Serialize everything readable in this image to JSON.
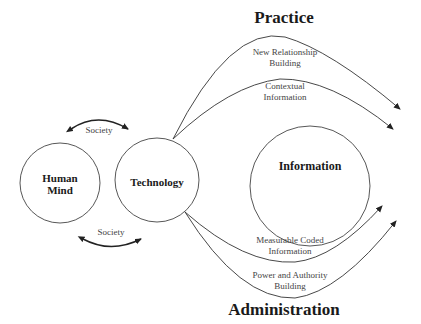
{
  "titles": {
    "top": "Practice",
    "bottom": "Administration"
  },
  "nodes": {
    "human_mind": {
      "line1": "Human",
      "line2": "Mind"
    },
    "technology": {
      "label": "Technology"
    },
    "information": {
      "label": "Information"
    }
  },
  "society": {
    "top_label": "Society",
    "bottom_label": "Society"
  },
  "flows": {
    "practice": [
      {
        "line1": "New Relationship",
        "line2": "Building"
      },
      {
        "line1": "Contextual",
        "line2": "Information"
      }
    ],
    "administration": [
      {
        "line1": "Measurable Coded",
        "line2": "Information"
      },
      {
        "line1": "Power and Authority",
        "line2": "Building"
      }
    ]
  },
  "colors": {
    "line": "#333333",
    "text": "#444444",
    "background": "#ffffff"
  }
}
